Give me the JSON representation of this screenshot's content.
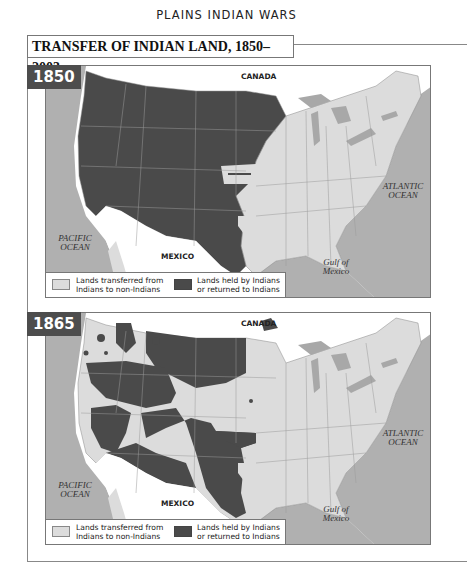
{
  "page_header": "PLAINS INDIAN WARS",
  "title": "TRANSFER OF INDIAN LAND, 1850–2003",
  "colors": {
    "indian_land": "#4a4a4a",
    "transferred_land": "#dcdcdc",
    "water": "#b0b0b0",
    "foreign_land": "#ffffff"
  },
  "maps": [
    {
      "year": "1850",
      "labels": {
        "canada": "CANADA",
        "mexico": "MEXICO",
        "pacific": "PACIFIC OCEAN",
        "atlantic": "ATLANTIC OCEAN",
        "gulf": "Gulf of Mexico"
      },
      "legend": {
        "transferred": "Lands transferred from Indians to non-Indians",
        "held": "Lands held by Indians or returned to Indians"
      }
    },
    {
      "year": "1865",
      "labels": {
        "canada": "CANADA",
        "mexico": "MEXICO",
        "pacific": "PACIFIC OCEAN",
        "atlantic": "ATLANTIC OCEAN",
        "gulf": "Gulf of Mexico"
      },
      "legend": {
        "transferred": "Lands transferred from Indians to non-Indians",
        "held": "Lands held by Indians or returned to Indians"
      }
    }
  ]
}
